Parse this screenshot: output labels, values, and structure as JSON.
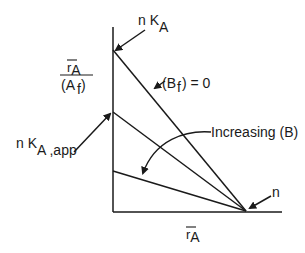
{
  "diagram": {
    "type": "binding-plot",
    "y_axis_label": {
      "numerator_base": "r",
      "numerator_sub": "A",
      "denominator": "(A",
      "denominator_sub": "f",
      "denominator_close": ")"
    },
    "x_axis_label": {
      "base": "r",
      "sub": "A"
    },
    "labels": {
      "top_intercept": {
        "prefix": "n K",
        "sub": "A"
      },
      "apparent_intercept": {
        "prefix": "n K",
        "sub": "A ,app"
      },
      "zero_line": {
        "open": "(B",
        "sub": "f",
        "close": ") = 0"
      },
      "trend": "Increasing (B)",
      "x_intercept": "n"
    },
    "lines": [
      {
        "name": "Bf=0",
        "y_intercept_px": 50,
        "x_intercept_px": 246
      },
      {
        "name": "intermediate B",
        "y_intercept_px": 112,
        "x_intercept_px": 246
      },
      {
        "name": "higher B",
        "y_intercept_px": 171,
        "x_intercept_px": 246
      }
    ],
    "colors": {
      "ink": "#1a1a1a",
      "background": "#ffffff"
    }
  }
}
